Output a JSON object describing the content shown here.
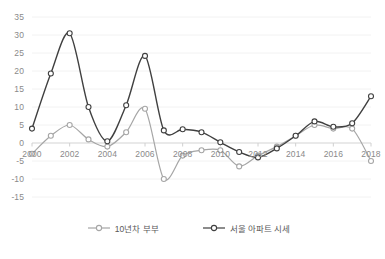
{
  "chart_data": {
    "type": "line",
    "title": "",
    "xlabel": "",
    "ylabel": "",
    "x": [
      2000,
      2001,
      2002,
      2003,
      2004,
      2005,
      2006,
      2007,
      2008,
      2009,
      2010,
      2011,
      2012,
      2013,
      2014,
      2015,
      2016,
      2017,
      2018
    ],
    "xlim": [
      2000,
      2018
    ],
    "ylim": [
      -15,
      35
    ],
    "yticks": [
      -15,
      -10,
      -5,
      0,
      5,
      10,
      15,
      20,
      25,
      30,
      35
    ],
    "xticks": [
      2000,
      2002,
      2004,
      2006,
      2008,
      2010,
      2012,
      2014,
      2016,
      2018
    ],
    "xtick_labels": [
      "2000",
      "2002",
      "2004",
      "2006",
      "2008",
      "2010",
      "2012",
      "2014",
      "2016",
      "2018"
    ],
    "ytick_labels": [
      "35",
      "30",
      "25",
      "20",
      "15",
      "10",
      "5",
      "0",
      "-5",
      "-10",
      "-15"
    ],
    "grid": true,
    "legend_position": "bottom",
    "series": [
      {
        "name": "10년차 부부",
        "color": "#a6a6a6",
        "marker": "circle-open",
        "values": [
          -3,
          2,
          5,
          1,
          -1,
          3,
          9.5,
          -10,
          -3.5,
          -2,
          -2,
          -6.5,
          -3.5,
          -1,
          2,
          5,
          4,
          4,
          -5
        ]
      },
      {
        "name": "서울 아파트 시세",
        "color": "#404040",
        "marker": "circle-open",
        "values": [
          4,
          19.3,
          30.5,
          10,
          0.5,
          10.5,
          24.2,
          3.5,
          3.8,
          3,
          0.2,
          -2.5,
          -4,
          -1.5,
          2,
          6,
          4.5,
          5.5,
          13
        ]
      }
    ]
  },
  "legend": {
    "items": [
      {
        "label": "10년차 부부",
        "color": "#a6a6a6"
      },
      {
        "label": "서울 아파트 시세",
        "color": "#404040"
      }
    ]
  },
  "axes": {
    "y_labels": [
      "35",
      "30",
      "25",
      "20",
      "15",
      "10",
      "5",
      "0",
      "-5",
      "-10",
      "-15"
    ],
    "x_labels": [
      "2000",
      "2002",
      "2004",
      "2006",
      "2008",
      "2010",
      "2012",
      "2014",
      "2016",
      "2018"
    ]
  }
}
